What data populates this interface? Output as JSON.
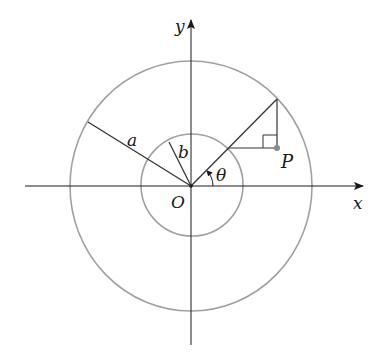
{
  "diagram": {
    "type": "geometry",
    "labels": {
      "x_axis": "x",
      "y_axis": "y",
      "origin": "O",
      "outer_radius": "a",
      "inner_radius": "b",
      "angle": "θ",
      "point": "P"
    },
    "colors": {
      "axis": "#1a1a1a",
      "circle": "#9a9a9a",
      "segment": "#333333",
      "point": "#8a8a8a"
    }
  }
}
